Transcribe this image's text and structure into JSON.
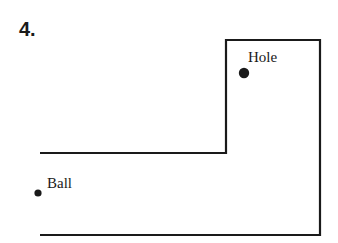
{
  "problem_number": "4.",
  "labels": {
    "hole": "Hole",
    "ball": "Ball"
  },
  "colors": {
    "ink": "#1a1a1a",
    "background": "#ffffff"
  }
}
